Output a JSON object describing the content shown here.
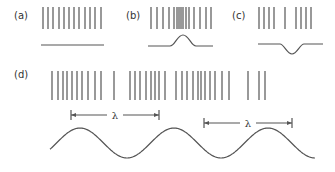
{
  "panels": {
    "a": {
      "label": "(a)",
      "label_pos": [
        14,
        19
      ],
      "lines_x": [
        43,
        48,
        53,
        59,
        64,
        69,
        74,
        79,
        85,
        90,
        95,
        101
      ],
      "lines_y": [
        7,
        29
      ],
      "profile": "M41 45 L104 45"
    },
    "b": {
      "label": "(b)",
      "label_pos": [
        126,
        19
      ],
      "lines_x": [
        151,
        157,
        163,
        169,
        174,
        177,
        179,
        181,
        183,
        186,
        189,
        194,
        200,
        206,
        211
      ],
      "lines_y": [
        7,
        29
      ],
      "profile": "M148 46 L170 46 C175 46 177 35 183 35 C189 35 191 46 196 46 L213 46"
    },
    "c": {
      "label": "(c)",
      "label_pos": [
        232,
        19
      ],
      "lines_x": [
        259,
        264,
        269,
        274,
        285,
        296,
        301,
        306,
        311
      ],
      "lines_y": [
        7,
        29
      ],
      "profile": "M258 44 L280 44 C284 44 287 54 292 54 C297 54 300 44 304 44 L323 44"
    },
    "d": {
      "label": "(d)",
      "label_pos": [
        14,
        78
      ],
      "lines_x": [
        52,
        58,
        63,
        67,
        72,
        77,
        82,
        88,
        95,
        101,
        114,
        130,
        135,
        140,
        146,
        151,
        155,
        159,
        165,
        176,
        182,
        187,
        193,
        198,
        201,
        205,
        210,
        215,
        222,
        229,
        248,
        259,
        265
      ],
      "lines_y": [
        71,
        100
      ],
      "wave": {
        "x_start": 50,
        "x_end": 315,
        "baseline_y": 143,
        "amplitude": 15,
        "period": 94,
        "phase_x": 80
      },
      "wavelengths": [
        {
          "label": "λ",
          "x1": 71,
          "x2": 159,
          "y": 115
        },
        {
          "label": "λ",
          "x1": 204,
          "x2": 292,
          "y": 123
        }
      ]
    }
  }
}
